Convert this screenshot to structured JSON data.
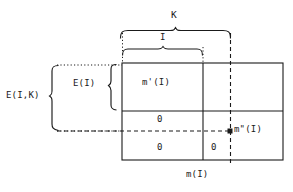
{
  "figure": {
    "title": "",
    "colors": {
      "line": "#1a1a1a",
      "background": "#ffffff"
    },
    "labels": {
      "k": "K",
      "i": "I",
      "e_i_k": "E(I,K)",
      "e_i": "E(I)",
      "m_prime_i": "m'(I)",
      "zero_upper_left": "0",
      "zero_lower_left": "0",
      "zero_lower_right": "0",
      "m_double_prime_i": "m\"(I)",
      "m_i": "m(I)"
    },
    "geometry": {
      "rect": {
        "x": 122,
        "y": 63,
        "width": 161,
        "height": 97
      },
      "horizontal_divider_y": 111,
      "vertical_divider_x": 203,
      "dashed_vertical_x": 230,
      "dashed_horizontal_y": 131,
      "brace_k": {
        "x1": 120,
        "x2": 231,
        "y": 30
      },
      "brace_i": {
        "x1": 122,
        "x2": 203,
        "y": 48
      },
      "brace_e_i_k": {
        "x": 52,
        "y1": 65,
        "y2": 131
      },
      "brace_e_i": {
        "x": 110,
        "y1": 64,
        "y2": 110
      },
      "marker_point": {
        "x": 230,
        "y": 131
      }
    }
  }
}
